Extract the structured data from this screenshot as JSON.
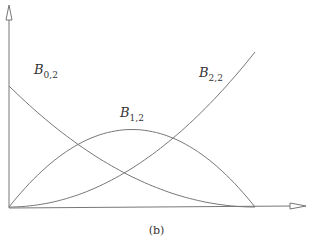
{
  "chart_data": {
    "type": "line",
    "title": "",
    "caption": "(b)",
    "xlabel": "",
    "ylabel": "",
    "grid": false,
    "xlim": [
      0,
      1
    ],
    "ylim": [
      0,
      1
    ],
    "x": [
      0,
      0.1,
      0.2,
      0.3,
      0.4,
      0.5,
      0.6,
      0.7,
      0.8,
      0.9,
      1.0
    ],
    "series": [
      {
        "name": "B0,2",
        "label_main": "B",
        "label_sub": "0,2",
        "values": [
          1.0,
          0.81,
          0.64,
          0.49,
          0.36,
          0.25,
          0.16,
          0.09,
          0.04,
          0.01,
          0.0
        ]
      },
      {
        "name": "B1,2",
        "label_main": "B",
        "label_sub": "1,2",
        "values": [
          0.0,
          0.18,
          0.32,
          0.42,
          0.48,
          0.5,
          0.48,
          0.42,
          0.32,
          0.18,
          0.0
        ]
      },
      {
        "name": "B2,2",
        "label_main": "B",
        "label_sub": "2,2",
        "values": [
          0.0,
          0.01,
          0.04,
          0.09,
          0.16,
          0.25,
          0.36,
          0.49,
          0.64,
          0.81,
          1.0
        ]
      }
    ],
    "legend": "inline labels"
  }
}
